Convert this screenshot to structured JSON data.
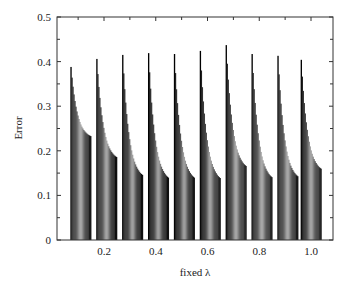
{
  "chart_data": {
    "type": "bar",
    "title": "",
    "xlabel": "fixed λ",
    "ylabel": "Error",
    "xlim": [
      0.0,
      1.1
    ],
    "ylim": [
      0,
      0.5
    ],
    "xticks": [
      0.2,
      0.4,
      0.6,
      0.8,
      1.0
    ],
    "xtick_labels": [
      "0.2",
      "0.4",
      "0.6",
      "0.8",
      "1.0"
    ],
    "yticks": [
      0,
      0.1,
      0.2,
      0.3,
      0.4,
      0.5
    ],
    "ytick_labels": [
      "0",
      "0.1",
      "0.2",
      "0.3",
      "0.4",
      "0.5"
    ],
    "grid": false,
    "legend": null,
    "groups": [
      {
        "x_start": 0.07,
        "x_end": 0.15,
        "peak": 0.388,
        "end": 0.233
      },
      {
        "x_start": 0.17,
        "x_end": 0.25,
        "peak": 0.406,
        "end": 0.186
      },
      {
        "x_start": 0.27,
        "x_end": 0.35,
        "peak": 0.415,
        "end": 0.146
      },
      {
        "x_start": 0.37,
        "x_end": 0.45,
        "peak": 0.419,
        "end": 0.14
      },
      {
        "x_start": 0.47,
        "x_end": 0.55,
        "peak": 0.417,
        "end": 0.14
      },
      {
        "x_start": 0.57,
        "x_end": 0.65,
        "peak": 0.424,
        "end": 0.139
      },
      {
        "x_start": 0.67,
        "x_end": 0.75,
        "peak": 0.437,
        "end": 0.166
      },
      {
        "x_start": 0.77,
        "x_end": 0.85,
        "peak": 0.417,
        "end": 0.141
      },
      {
        "x_start": 0.87,
        "x_end": 0.95,
        "peak": 0.413,
        "end": 0.143
      },
      {
        "x_start": 0.96,
        "x_end": 1.04,
        "peak": 0.404,
        "end": 0.16
      }
    ]
  },
  "labels": {
    "xlabel": "fixed λ",
    "ylabel": "Error"
  }
}
